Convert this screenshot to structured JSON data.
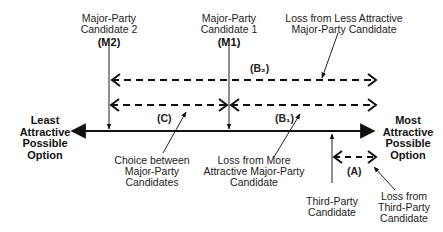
{
  "diagram": {
    "left_endpoint": {
      "lines": [
        "Least",
        "Attractive",
        "Possible",
        "Option"
      ]
    },
    "right_endpoint": {
      "lines": [
        "Most",
        "Attractive",
        "Possible",
        "Option"
      ]
    },
    "candidates": {
      "m2": {
        "lines": [
          "Major-Party",
          "Candidate 2"
        ],
        "code": "(M2)"
      },
      "m1": {
        "lines": [
          "Major-Party",
          "Candidate 1"
        ],
        "code": "(M1)"
      },
      "third": {
        "lines": [
          "Third-Party",
          "Candidate"
        ]
      }
    },
    "segments": {
      "b2": "(B₂)",
      "c": "(C)",
      "b1": "(B₁)",
      "a": "(A)"
    },
    "annotations": {
      "loss_less_attractive": {
        "lines": [
          "Loss from Less Attractive",
          "Major-Party Candidate"
        ]
      },
      "choice_between": {
        "lines": [
          "Choice between",
          "Major-Party",
          "Candidates"
        ]
      },
      "loss_more_attractive": {
        "lines": [
          "Loss from More",
          "Attractive Major-Party",
          "Candidate"
        ]
      },
      "loss_third_party": {
        "lines": [
          "Loss from",
          "Third-Party",
          "Candidate"
        ]
      }
    }
  }
}
